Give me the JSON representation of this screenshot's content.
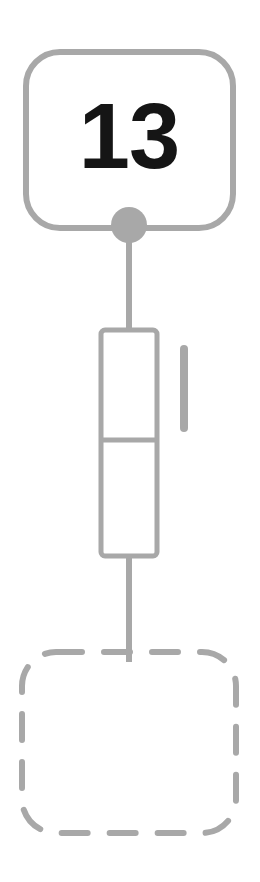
{
  "diagram": {
    "type": "flow-node-diagram",
    "background_color": "#ffffff",
    "stroke_color": "#a8a8a8",
    "fill_color": "#ffffff",
    "circle_fill_color": "#a8a8a8",
    "connector_color": "#a8a8a8",
    "number_color": "#151515",
    "nodes": [
      {
        "id": "top-node",
        "shape": "rounded-rectangle",
        "style": "solid",
        "label": "13",
        "x": 26,
        "y": 52,
        "width": 207,
        "height": 176,
        "corner_radius": 34,
        "stroke_width": 6
      },
      {
        "id": "middle-node",
        "shape": "rectangle",
        "style": "solid",
        "label": "",
        "x": 101,
        "y": 330,
        "width": 56,
        "height": 226,
        "corner_radius": 4,
        "stroke_width": 5,
        "divider_y": 440
      },
      {
        "id": "bottom-node",
        "shape": "rounded-rectangle",
        "style": "dashed",
        "label": "",
        "x": 22,
        "y": 652,
        "width": 214,
        "height": 181,
        "corner_radius": 34,
        "stroke_width": 6,
        "dash_pattern": "26 22"
      }
    ],
    "connectors": [
      {
        "id": "connector-top-to-middle",
        "from": "top-node",
        "to": "middle-node",
        "x": 129,
        "y1": 225,
        "y2": 332,
        "width": 6
      },
      {
        "id": "connector-middle-to-bottom",
        "from": "middle-node",
        "to": "bottom-node",
        "x": 129,
        "y1": 554,
        "y2": 660,
        "width": 6
      }
    ],
    "port": {
      "id": "connection-port",
      "shape": "circle",
      "cx": 129,
      "cy": 225,
      "r": 18
    },
    "accessory": {
      "id": "side-bar",
      "shape": "rounded-bar",
      "x": 180,
      "y": 345,
      "width": 8,
      "height": 87,
      "corner_radius": 4
    }
  }
}
